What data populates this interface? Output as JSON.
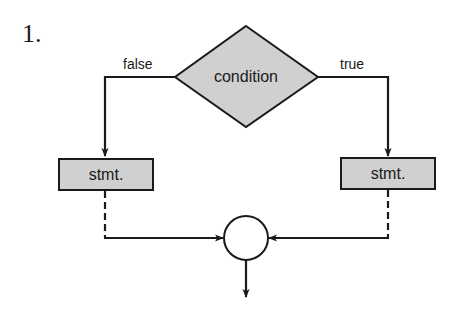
{
  "figure": {
    "number_label": "1."
  },
  "nodes": {
    "condition": {
      "label": "condition",
      "shape": "diamond",
      "fill": "#d0d0d0"
    },
    "stmt_false": {
      "label": "stmt.",
      "shape": "rectangle",
      "fill": "#d0d0d0"
    },
    "stmt_true": {
      "label": "stmt.",
      "shape": "rectangle",
      "fill": "#d0d0d0"
    },
    "join": {
      "label": "",
      "shape": "circle",
      "fill": "#ffffff"
    }
  },
  "edges": {
    "false_label": "false",
    "true_label": "true"
  },
  "colors": {
    "stroke": "#1a1a1a",
    "shape_fill": "#d0d0d0",
    "background": "#ffffff"
  }
}
